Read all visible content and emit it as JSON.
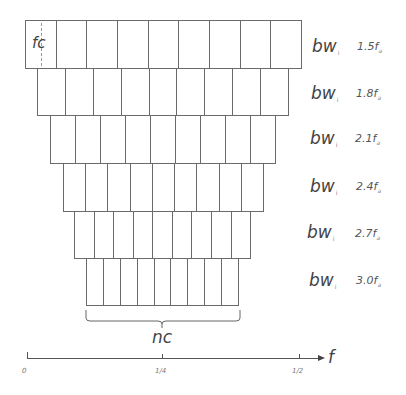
{
  "diagram": {
    "title": "",
    "cells_per_row": 9,
    "first_cell_label": "fc",
    "rows": [
      {
        "bw_label": "bw",
        "bw_sub": "i",
        "factor": "1.5f",
        "factor_sub": "a"
      },
      {
        "bw_label": "bw",
        "bw_sub": "i",
        "factor": "1.8f",
        "factor_sub": "a"
      },
      {
        "bw_label": "bw",
        "bw_sub": "i",
        "factor": "2.1f",
        "factor_sub": "a"
      },
      {
        "bw_label": "bw",
        "bw_sub": "i",
        "factor": "2.4f",
        "factor_sub": "a"
      },
      {
        "bw_label": "bw",
        "bw_sub": "i",
        "factor": "2.7f",
        "factor_sub": "a"
      },
      {
        "bw_label": "bw",
        "bw_sub": "i",
        "factor": "3.0f",
        "factor_sub": "a"
      }
    ],
    "brace_label": "nc",
    "axis": {
      "label": "f",
      "ticks": [
        "0",
        "1/4",
        "1/2"
      ]
    }
  }
}
